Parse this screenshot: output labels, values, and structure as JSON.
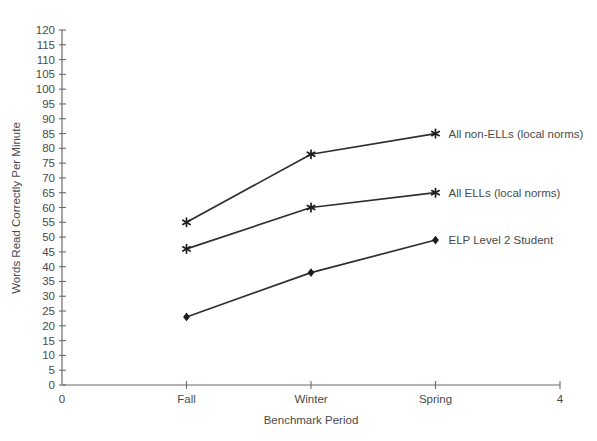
{
  "chart_data": {
    "type": "line",
    "title": "",
    "xlabel": "Benchmark Period",
    "ylabel": "Words Read Correctly Per Minute",
    "categories": [
      "Fall",
      "Winter",
      "Spring"
    ],
    "xlim": [
      0,
      4
    ],
    "ylim": [
      0,
      120
    ],
    "ytick_step": 5,
    "yticks": [
      0,
      5,
      10,
      15,
      20,
      25,
      30,
      35,
      40,
      45,
      50,
      55,
      60,
      65,
      70,
      75,
      80,
      85,
      90,
      95,
      100,
      105,
      110,
      115,
      120
    ],
    "xticks": [
      {
        "x": 0,
        "label": "0"
      },
      {
        "x": 1,
        "label": "Fall"
      },
      {
        "x": 2,
        "label": "Winter"
      },
      {
        "x": 3,
        "label": "Spring"
      },
      {
        "x": 4,
        "label": "4"
      }
    ],
    "grid": false,
    "legend_position": "line-end-labels",
    "colors": {
      "line": "#2e2e2e",
      "marker": "#1c1c1c",
      "axis": "#6b6b6b",
      "text": "#4a4a4a",
      "background": "#ffffff"
    },
    "series": [
      {
        "name": "All non-ELLs (local norms)",
        "x": [
          1,
          2,
          3
        ],
        "values": [
          55,
          78,
          85
        ],
        "marker": "star"
      },
      {
        "name": "All ELLs (local norms)",
        "x": [
          1,
          2,
          3
        ],
        "values": [
          46,
          60,
          65
        ],
        "marker": "star"
      },
      {
        "name": "ELP Level 2 Student",
        "x": [
          1,
          2,
          3
        ],
        "values": [
          23,
          38,
          49
        ],
        "marker": "diamond"
      }
    ]
  }
}
